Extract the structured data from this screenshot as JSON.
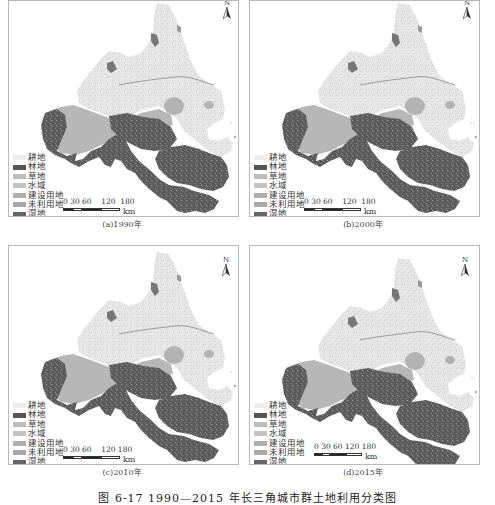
{
  "figure": {
    "caption": "图 6-17  1990—2015 年长三角城市群土地利用分类图"
  },
  "legend_colors": {
    "耕地": "#ececec",
    "林地": "#5a5a5a",
    "草地": "#bdbdbd",
    "水域": "#c6c6c6",
    "建设用地": "#b0b0b0",
    "未利用地": "#a8a8a8",
    "湿地": "#686868"
  },
  "panels": [
    {
      "caption": "(a)1990年",
      "north_label": "N",
      "legend": [
        "耕地",
        "林地",
        "草地",
        "水域",
        "建设用地",
        "未利用地",
        "湿地"
      ],
      "scale": {
        "ticks": "0 30 60    120  180",
        "unit": "km"
      }
    },
    {
      "caption": "(b)2000年",
      "north_label": "N",
      "legend": [
        "耕地",
        "林地",
        "草地",
        "水域",
        "建设用地",
        "未利用地",
        "湿地"
      ],
      "scale": {
        "ticks": "0 30 60    120  180",
        "unit": "km"
      }
    },
    {
      "caption": "(c)2010年",
      "north_label": "N",
      "legend": [
        "耕地",
        "林地",
        "草地",
        "水域",
        "建设用地",
        "未利用地",
        "湿地"
      ],
      "scale": {
        "ticks": "0 30 60    120 180",
        "unit": "km"
      }
    },
    {
      "caption": "(d)2015年",
      "north_label": "N",
      "legend": [
        "耕地",
        "林地",
        "草地",
        "水域",
        "建设用地",
        "未利用地",
        "湿地"
      ],
      "scale": {
        "ticks": "0 30 60 120 180",
        "unit": "km"
      }
    }
  ]
}
